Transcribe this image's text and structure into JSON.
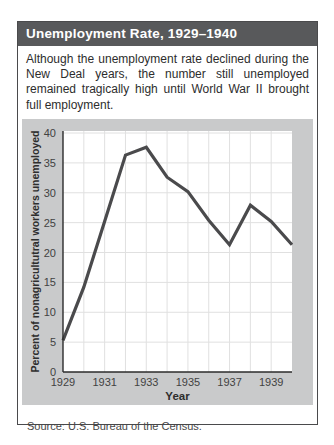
{
  "figure": {
    "title": "Unemployment Rate, 1929–1940",
    "description": "Although the unemployment rate declined during the New Deal years, the number still unemployed remained tragically high until World War II brought full employment.",
    "source": "Source: U.S. Bureau of the Census."
  },
  "colors": {
    "title_bar_bg": "#58595b",
    "title_text": "#ffffff",
    "panel_bg": "#c9cacb",
    "plot_bg": "#ffffff",
    "gridline": "#e0e0e0",
    "axis": "#2b2b2b",
    "line": "#4a4a4c",
    "tick_text": "#424242"
  },
  "chart_data": {
    "type": "line",
    "title": "",
    "xlabel": "Year",
    "ylabel": "Percent of nonagricultutral workers unemployed",
    "x": [
      1929,
      1930,
      1931,
      1932,
      1933,
      1934,
      1935,
      1936,
      1937,
      1938,
      1939,
      1940
    ],
    "values": [
      5.3,
      14.2,
      25.2,
      36.3,
      37.6,
      32.6,
      30.2,
      25.4,
      21.3,
      27.9,
      25.2,
      21.3
    ],
    "series_name": "Percent of nonagricultural workers unemployed",
    "xlim": [
      1929,
      1940
    ],
    "ylim": [
      0,
      40
    ],
    "yticks": [
      0,
      5,
      10,
      15,
      20,
      25,
      30,
      35,
      40
    ],
    "xticks": [
      1929,
      1931,
      1933,
      1935,
      1937,
      1939
    ],
    "grid": true,
    "legend": false
  }
}
